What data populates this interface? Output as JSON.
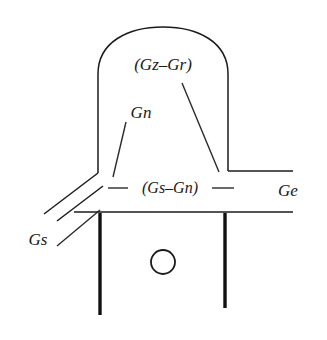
{
  "figure": {
    "name": "cross-section-line-diagram",
    "background_color": "#ffffff",
    "line_color": "#1b1b1b",
    "text_color": "#1a1a1a",
    "width": 327,
    "height": 340,
    "labels": {
      "top": "(Gz–Gr)",
      "upper_left": "Gn",
      "middle": "(Gs–Gn)",
      "right": "Ge",
      "lower_left": "Gs"
    }
  }
}
